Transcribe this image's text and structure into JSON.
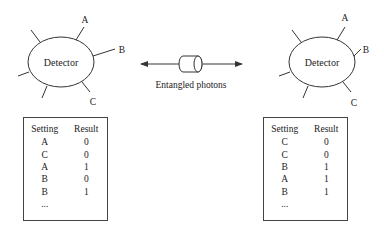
{
  "diagram": {
    "left_detector": {
      "label": "Detector",
      "settings": [
        "A",
        "B",
        "C"
      ]
    },
    "right_detector": {
      "label": "Detector",
      "settings": [
        "A",
        "B",
        "C"
      ]
    },
    "source": {
      "label": "Entangled photons",
      "icon": "photon-source-cylinder-icon"
    },
    "left_table": {
      "headers": [
        "Setting",
        "Result"
      ],
      "rows": [
        [
          "A",
          "0"
        ],
        [
          "C",
          "0"
        ],
        [
          "A",
          "1"
        ],
        [
          "B",
          "0"
        ],
        [
          "B",
          "1"
        ]
      ],
      "ellipsis": "..."
    },
    "right_table": {
      "headers": [
        "Setting",
        "Result"
      ],
      "rows": [
        [
          "C",
          "0"
        ],
        [
          "C",
          "0"
        ],
        [
          "B",
          "1"
        ],
        [
          "A",
          "1"
        ],
        [
          "B",
          "1"
        ]
      ],
      "ellipsis": "..."
    }
  }
}
